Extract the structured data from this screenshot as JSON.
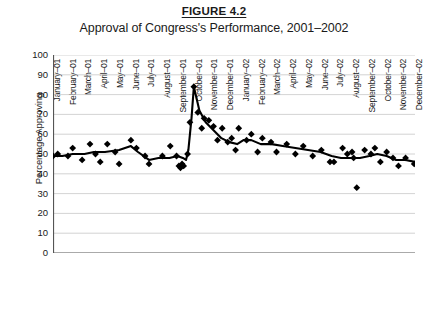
{
  "figure": {
    "number_label": "FIGURE 4.2",
    "title": "Approval of Congress's Performance, 2001–2002"
  },
  "axes": {
    "y_axis_title": "Percentage Approving",
    "y_ticks": [
      "0",
      "10",
      "20",
      "30",
      "40",
      "50",
      "60",
      "70",
      "80",
      "90",
      "100"
    ],
    "x_ticks": [
      "January–01",
      "February–01",
      "March–01",
      "April–01",
      "May–01",
      "June–01",
      "July–01",
      "August–01",
      "September–01",
      "October–01",
      "November–01",
      "December–01",
      "January–02",
      "February–02",
      "March–02",
      "April–02",
      "May–02",
      "June–02",
      "July–02",
      "August–02",
      "September–02",
      "October–02",
      "November–02",
      "December–02"
    ]
  },
  "style": {
    "grid_color": "#c8c8c8",
    "axis_color": "#555555",
    "series_color": "#000000",
    "marker_color": "#000000",
    "background": "#ffffff"
  },
  "chart_data": {
    "type": "scatter",
    "title": "Approval of Congress's Performance, 2001–2002",
    "xlabel": "",
    "ylabel": "Percentage Approving",
    "ylim": [
      0,
      100
    ],
    "ytick_step": 10,
    "grid": true,
    "legend": "none",
    "categories": [
      "January–01",
      "February–01",
      "March–01",
      "April–01",
      "May–01",
      "June–01",
      "July–01",
      "August–01",
      "September–01",
      "October–01",
      "November–01",
      "December–01",
      "January–02",
      "February–02",
      "March–02",
      "April–02",
      "May–02",
      "June–02",
      "July–02",
      "August–02",
      "September–02",
      "October–02",
      "November–02",
      "December–02"
    ],
    "series": [
      {
        "name": "Individual poll results",
        "type": "scatter",
        "marker": "diamond",
        "points": [
          {
            "x": 0.0,
            "y": 49
          },
          {
            "x": 0.3,
            "y": 50
          },
          {
            "x": 0.95,
            "y": 49
          },
          {
            "x": 1.25,
            "y": 53
          },
          {
            "x": 1.85,
            "y": 47
          },
          {
            "x": 2.35,
            "y": 55
          },
          {
            "x": 2.7,
            "y": 50
          },
          {
            "x": 3.0,
            "y": 46
          },
          {
            "x": 3.45,
            "y": 55
          },
          {
            "x": 3.95,
            "y": 51
          },
          {
            "x": 4.2,
            "y": 45
          },
          {
            "x": 4.95,
            "y": 57
          },
          {
            "x": 5.3,
            "y": 53
          },
          {
            "x": 5.85,
            "y": 49
          },
          {
            "x": 6.1,
            "y": 45
          },
          {
            "x": 6.95,
            "y": 49
          },
          {
            "x": 7.45,
            "y": 54
          },
          {
            "x": 7.85,
            "y": 49
          },
          {
            "x": 8.0,
            "y": 44
          },
          {
            "x": 8.1,
            "y": 43
          },
          {
            "x": 8.2,
            "y": 45
          },
          {
            "x": 8.3,
            "y": 44
          },
          {
            "x": 8.55,
            "y": 50
          },
          {
            "x": 8.7,
            "y": 66
          },
          {
            "x": 8.95,
            "y": 84
          },
          {
            "x": 9.2,
            "y": 71
          },
          {
            "x": 9.45,
            "y": 63
          },
          {
            "x": 9.6,
            "y": 68
          },
          {
            "x": 9.9,
            "y": 67
          },
          {
            "x": 10.2,
            "y": 64
          },
          {
            "x": 10.45,
            "y": 57
          },
          {
            "x": 10.75,
            "y": 63
          },
          {
            "x": 11.1,
            "y": 56
          },
          {
            "x": 11.35,
            "y": 58
          },
          {
            "x": 11.6,
            "y": 52
          },
          {
            "x": 11.8,
            "y": 63
          },
          {
            "x": 12.3,
            "y": 57
          },
          {
            "x": 12.6,
            "y": 60
          },
          {
            "x": 13.0,
            "y": 51
          },
          {
            "x": 13.3,
            "y": 58
          },
          {
            "x": 13.85,
            "y": 56
          },
          {
            "x": 14.2,
            "y": 51
          },
          {
            "x": 14.85,
            "y": 55
          },
          {
            "x": 15.4,
            "y": 50
          },
          {
            "x": 15.9,
            "y": 54
          },
          {
            "x": 16.5,
            "y": 49
          },
          {
            "x": 17.05,
            "y": 52
          },
          {
            "x": 17.6,
            "y": 46
          },
          {
            "x": 17.85,
            "y": 46
          },
          {
            "x": 18.4,
            "y": 53
          },
          {
            "x": 18.7,
            "y": 50
          },
          {
            "x": 19.0,
            "y": 51
          },
          {
            "x": 19.1,
            "y": 48
          },
          {
            "x": 19.3,
            "y": 33
          },
          {
            "x": 19.8,
            "y": 52
          },
          {
            "x": 20.2,
            "y": 50
          },
          {
            "x": 20.45,
            "y": 53
          },
          {
            "x": 20.8,
            "y": 46
          },
          {
            "x": 21.2,
            "y": 51
          },
          {
            "x": 21.6,
            "y": 48
          },
          {
            "x": 21.95,
            "y": 44
          },
          {
            "x": 22.4,
            "y": 48
          },
          {
            "x": 22.95,
            "y": 45
          },
          {
            "x": 23.4,
            "y": 49
          },
          {
            "x": 23.85,
            "y": 48
          }
        ]
      },
      {
        "name": "Smoothed trend",
        "type": "line",
        "points": [
          {
            "x": 0.0,
            "y": 49
          },
          {
            "x": 0.6,
            "y": 49
          },
          {
            "x": 1.25,
            "y": 50
          },
          {
            "x": 2.0,
            "y": 50
          },
          {
            "x": 2.6,
            "y": 51
          },
          {
            "x": 3.3,
            "y": 51
          },
          {
            "x": 4.2,
            "y": 52
          },
          {
            "x": 4.95,
            "y": 54
          },
          {
            "x": 5.4,
            "y": 51
          },
          {
            "x": 6.1,
            "y": 47
          },
          {
            "x": 6.7,
            "y": 48
          },
          {
            "x": 7.4,
            "y": 48
          },
          {
            "x": 7.9,
            "y": 49
          },
          {
            "x": 8.25,
            "y": 48
          },
          {
            "x": 8.45,
            "y": 47
          },
          {
            "x": 8.6,
            "y": 52
          },
          {
            "x": 8.8,
            "y": 68
          },
          {
            "x": 8.95,
            "y": 84
          },
          {
            "x": 9.3,
            "y": 72
          },
          {
            "x": 9.7,
            "y": 66
          },
          {
            "x": 10.2,
            "y": 62
          },
          {
            "x": 10.7,
            "y": 58
          },
          {
            "x": 11.2,
            "y": 56
          },
          {
            "x": 11.7,
            "y": 55
          },
          {
            "x": 12.1,
            "y": 57
          },
          {
            "x": 12.6,
            "y": 57
          },
          {
            "x": 13.2,
            "y": 55
          },
          {
            "x": 13.9,
            "y": 55
          },
          {
            "x": 14.6,
            "y": 54
          },
          {
            "x": 15.4,
            "y": 53
          },
          {
            "x": 16.2,
            "y": 52
          },
          {
            "x": 17.0,
            "y": 51
          },
          {
            "x": 17.7,
            "y": 49
          },
          {
            "x": 18.3,
            "y": 48
          },
          {
            "x": 18.9,
            "y": 48
          },
          {
            "x": 19.5,
            "y": 48
          },
          {
            "x": 20.1,
            "y": 49
          },
          {
            "x": 20.6,
            "y": 50
          },
          {
            "x": 21.2,
            "y": 49
          },
          {
            "x": 21.8,
            "y": 47
          },
          {
            "x": 22.4,
            "y": 47
          },
          {
            "x": 23.0,
            "y": 46
          },
          {
            "x": 23.45,
            "y": 47
          },
          {
            "x": 23.85,
            "y": 48
          }
        ]
      }
    ]
  }
}
